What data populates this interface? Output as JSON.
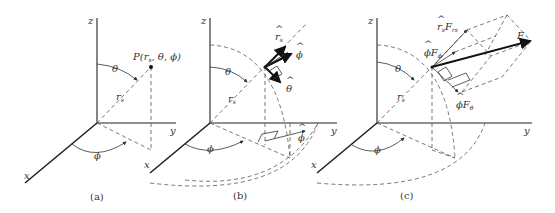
{
  "figure": {
    "panels": [
      {
        "id": "a",
        "caption": "(a)",
        "axis_labels": {
          "x": "x",
          "y": "y",
          "z": "z"
        },
        "point_label": "P(r_s, θ, ϕ)",
        "point_label_display": "P(r",
        "point_label_sub": "s",
        "point_label_rest": ", θ, ϕ)",
        "angle_labels": {
          "theta": "θ",
          "phi": "ϕ"
        },
        "radius_label": "r",
        "radius_sub": "s"
      },
      {
        "id": "b",
        "caption": "(b)",
        "axis_labels": {
          "x": "x",
          "y": "y",
          "z": "z"
        },
        "angle_labels": {
          "theta": "θ",
          "phi": "ϕ"
        },
        "radius_label": "r",
        "radius_sub": "s",
        "unit_vectors": {
          "r_hat": "r",
          "r_hat_sub": "s",
          "phi_hat": "ϕ",
          "theta_hat": "θ",
          "phi_hat_ground": "ϕ",
          "hat": "^"
        }
      },
      {
        "id": "c",
        "caption": "(c)",
        "axis_labels": {
          "x": "x",
          "y": "y",
          "z": "z"
        },
        "angle_labels": {
          "theta": "θ",
          "phi": "ϕ"
        },
        "radius_label": "r",
        "radius_sub": "s",
        "force_label": "F",
        "components": {
          "r_component": "r",
          "r_component_sub": "s",
          "r_component_F": "F",
          "r_component_F_sub": "rs",
          "phi_component": "ϕF",
          "phi_component_sub": "ϕ",
          "theta_component": "ϕF",
          "theta_component_sub": "θ",
          "hat": "^"
        }
      }
    ]
  }
}
